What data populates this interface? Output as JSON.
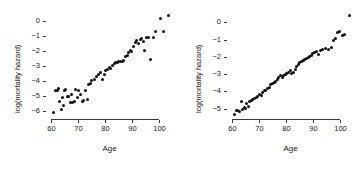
{
  "figure": {
    "background": "#ffffff",
    "point_color": "#111111",
    "axis_color": "#3a3a3a"
  },
  "chart_data": [
    {
      "type": "scatter",
      "panel": "left",
      "title": "",
      "xlabel": "Age",
      "ylabel": "log(mortality hazard)",
      "xlim": [
        58,
        105
      ],
      "ylim": [
        -6.5,
        0.6
      ],
      "xticks": [
        60,
        70,
        80,
        90,
        100
      ],
      "yticks": [
        0,
        -1,
        -2,
        -3,
        -4,
        -5,
        -6
      ],
      "ytick_labels": [
        "0",
        "-1",
        "-2",
        "-3",
        "-4",
        "-5",
        "-6"
      ],
      "grid": false,
      "legend": false,
      "x": [
        60.6,
        61.5,
        62.2,
        62.6,
        63.1,
        63.6,
        64.0,
        64.4,
        64.9,
        65.4,
        65.9,
        66.4,
        66.9,
        67.4,
        67.9,
        68.4,
        69.0,
        69.6,
        70.2,
        70.8,
        71.4,
        72.0,
        72.6,
        73.2,
        73.8,
        74.4,
        75.0,
        75.8,
        76.6,
        77.4,
        78.2,
        79.0,
        79.8,
        80.2,
        80.8,
        81.4,
        82.0,
        82.6,
        83.2,
        83.8,
        84.4,
        85.0,
        85.6,
        86.2,
        86.8,
        87.4,
        88.0,
        88.6,
        89.2,
        89.8,
        90.4,
        91.0,
        91.6,
        92.2,
        92.8,
        93.4,
        94.0,
        94.6,
        95.2,
        96.0,
        96.8,
        97.6,
        98.6,
        100.2,
        101.4,
        103.4
      ],
      "y": [
        -6.08,
        -4.62,
        -4.58,
        -4.48,
        -5.32,
        -5.85,
        -5.05,
        -5.58,
        -4.63,
        -4.55,
        -5.02,
        -4.98,
        -5.4,
        -4.9,
        -5.38,
        -5.32,
        -4.52,
        -5.1,
        -4.62,
        -4.88,
        -5.35,
        -5.3,
        -4.6,
        -5.22,
        -4.2,
        -4.12,
        -3.92,
        -3.88,
        -3.68,
        -3.55,
        -3.42,
        -3.9,
        -3.58,
        -3.3,
        -3.22,
        -3.05,
        -3.18,
        -2.92,
        -2.8,
        -2.78,
        -2.72,
        -2.7,
        -2.68,
        -2.7,
        -2.62,
        -2.38,
        -2.3,
        -2.1,
        -1.95,
        -2.05,
        -1.7,
        -1.4,
        -1.3,
        -1.52,
        -1.22,
        -1.18,
        -1.35,
        -1.95,
        -1.12,
        -1.1,
        -2.55,
        -1.08,
        -0.72,
        0.15,
        -0.7,
        0.4
      ]
    },
    {
      "type": "scatter",
      "panel": "right",
      "title": "",
      "xlabel": "Age",
      "ylabel": "log(mortality hazard)",
      "xlim": [
        58,
        105
      ],
      "ylim": [
        -5.6,
        0.6
      ],
      "xticks": [
        60,
        70,
        80,
        90,
        100
      ],
      "yticks": [
        0,
        -1,
        -2,
        -3,
        -4,
        -5
      ],
      "ytick_labels": [
        "0",
        "-1",
        "-2",
        "-3",
        "-4",
        "-5"
      ],
      "grid": false,
      "legend": false,
      "x": [
        60.6,
        61.4,
        62.0,
        62.6,
        63.2,
        63.8,
        64.3,
        64.8,
        65.3,
        65.8,
        66.4,
        67.0,
        67.6,
        68.2,
        68.8,
        69.4,
        70.0,
        70.6,
        71.2,
        71.8,
        72.4,
        73.0,
        73.6,
        74.2,
        74.8,
        75.4,
        76.0,
        76.6,
        77.2,
        77.8,
        78.4,
        79.0,
        79.6,
        80.2,
        80.8,
        81.4,
        82.0,
        82.6,
        83.2,
        83.8,
        84.4,
        85.0,
        85.6,
        86.2,
        86.8,
        87.4,
        88.0,
        88.6,
        89.2,
        89.8,
        90.4,
        91.0,
        91.8,
        92.6,
        93.4,
        94.6,
        95.6,
        96.6,
        97.4,
        98.2,
        99.0,
        99.8,
        100.6,
        101.4,
        103.4
      ],
      "y": [
        -5.35,
        -5.1,
        -5.08,
        -5.18,
        -4.58,
        -5.05,
        -4.95,
        -5.02,
        -4.72,
        -4.9,
        -4.6,
        -4.52,
        -4.48,
        -4.42,
        -4.35,
        -4.3,
        -4.18,
        -4.22,
        -4.05,
        -3.95,
        -3.92,
        -3.82,
        -3.78,
        -3.62,
        -3.55,
        -3.48,
        -3.4,
        -3.3,
        -3.22,
        -3.1,
        -3.2,
        -3.08,
        -3.0,
        -2.95,
        -2.92,
        -2.8,
        -2.98,
        -2.9,
        -2.72,
        -2.55,
        -2.42,
        -2.35,
        -2.28,
        -2.22,
        -2.15,
        -2.1,
        -2.02,
        -1.98,
        -1.9,
        -1.82,
        -1.75,
        -1.68,
        -1.88,
        -1.62,
        -1.58,
        -1.5,
        -1.55,
        -1.48,
        -1.05,
        -0.92,
        -0.6,
        -0.55,
        -0.78,
        -0.72,
        0.42
      ]
    }
  ]
}
